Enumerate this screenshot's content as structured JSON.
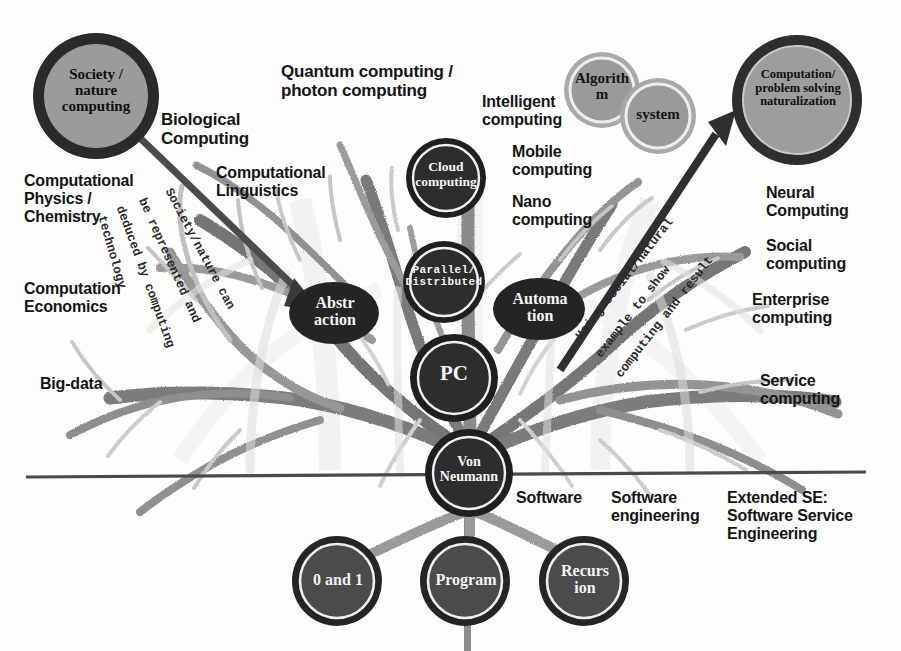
{
  "diagram": {
    "title_hidden": "",
    "background_color": "#fdfdfc",
    "baseline_color": "#4a4a4a",
    "branch_colors": {
      "dark": "#6f6f6f",
      "mid": "#8f8f8f",
      "light": "#bdbdbd",
      "pale": "#d8d8d8"
    },
    "node_colors": {
      "dark_fill": "#2b2b2b",
      "dark_ring": "#1e1e1e",
      "inner_white_ring": "#f2f2f2",
      "gray_fill": "#9a9a9a",
      "gray_ring": "#a9a9a9",
      "root_fill": "#4a4a4a",
      "arrow": "#3a3a3a"
    }
  },
  "nodes": {
    "society_nature": {
      "label": "Society /\nnature\ncomputing",
      "style": "gray-fill-dark-ring",
      "text_color": "#101010"
    },
    "computation_goal": {
      "label": "Computation/\nproblem solving\nnaturalization",
      "style": "gray-fill-dark-ring",
      "text_color": "#101010"
    },
    "algorithm": {
      "label": "Algorith\nm",
      "style": "gray-fill-gray-ring",
      "text_color": "#151515"
    },
    "system": {
      "label": "system",
      "style": "gray-fill-gray-ring",
      "text_color": "#151515"
    },
    "cloud": {
      "label": "Cloud\ncomputing",
      "style": "dark-fill",
      "text_color": "#f6f6f6"
    },
    "parallel": {
      "label": "Parallel/\nDistributed",
      "style": "dark-fill",
      "text_color": "#f6f6f6"
    },
    "pc": {
      "label": "PC",
      "style": "dark-fill",
      "text_color": "#f6f6f6"
    },
    "von_neumann": {
      "label": "Von\nNeumann",
      "style": "dark-fill",
      "text_color": "#f6f6f6"
    },
    "abstraction": {
      "label": "Abstr\naction",
      "style": "dark-ellipse",
      "text_color": "#f6f6f6"
    },
    "automation": {
      "label": "Automa\ntion",
      "style": "dark-ellipse",
      "text_color": "#f6f6f6"
    },
    "zero_one": {
      "label": "0 and 1",
      "style": "root",
      "text_color": "#f2f2f2"
    },
    "program": {
      "label": "Program",
      "style": "root",
      "text_color": "#f2f2f2"
    },
    "recursion": {
      "label": "Recurs\nion",
      "style": "root",
      "text_color": "#f2f2f2"
    }
  },
  "labels": {
    "biological_computing": "Biological\nComputing",
    "quantum_photon": "Quantum computing /\nphoton computing",
    "intelligent_computing": "Intelligent\ncomputing",
    "mobile_computing": "Mobile\ncomputing",
    "nano_computing": "Nano\ncomputing",
    "computational_linguistics": "Computational\nLinguistics",
    "computational_physics": "Computational\nPhysics /\nChemistry",
    "computation_economics": "Computation\nEconomics",
    "big_data": "Big-data",
    "neural_computing": "Neural\nComputing",
    "social_computing": "Social\ncomputing",
    "enterprise_computing": "Enterprise\ncomputing",
    "service_computing": "Service\ncomputing",
    "software": "Software",
    "software_engineering": "Software\nengineering",
    "extended_se": "Extended SE:\nSoftware Service\nEngineering"
  },
  "curved_annotations": {
    "left": "Society/nature can be represented and deduced by computing technology",
    "left_parts": [
      "Society/nature can",
      "be represented and",
      "deduced by computing",
      "technology"
    ],
    "right": "Using social/natural example to show computing and result",
    "right_parts": [
      "Using social/natural",
      "example to show",
      "computing and result"
    ]
  },
  "arrows": {
    "left_arrow": "society-to-abstraction",
    "right_arrow": "automation-to-computation-goal"
  }
}
